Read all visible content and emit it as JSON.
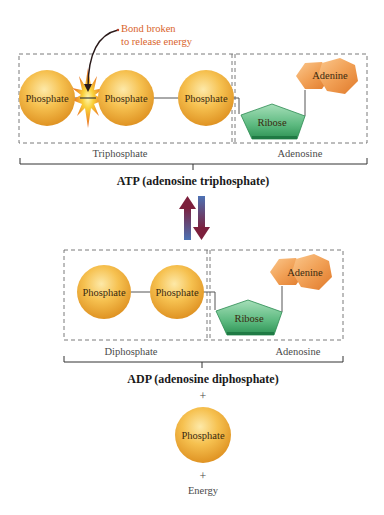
{
  "colors": {
    "phosphate_light": "#fde08a",
    "phosphate_mid": "#f3b03a",
    "phosphate_dark": "#d98a1a",
    "ribose_light": "#7fcf9c",
    "ribose_dark": "#2f9a5a",
    "adenine_light": "#f7b574",
    "adenine_dark": "#e27a2a",
    "annotation": "#d9642b",
    "arrow_up": "#7a2040",
    "arrow_down": "#3e6aa8",
    "dash": "#666666",
    "bracket": "#333333"
  },
  "annotation": {
    "line1": "Bond broken",
    "line2": "to release energy"
  },
  "atp": {
    "phosphates": [
      "Phosphate",
      "Phosphate",
      "Phosphate"
    ],
    "ribose": "Ribose",
    "adenine": "Adenine",
    "group_left": "Triphosphate",
    "group_right": "Adenosine",
    "title": "ATP (adenosine triphosphate)"
  },
  "adp": {
    "phosphates": [
      "Phosphate",
      "Phosphate"
    ],
    "ribose": "Ribose",
    "adenine": "Adenine",
    "group_left": "Diphosphate",
    "group_right": "Adenosine",
    "title": "ADP (adenosine diphosphate)"
  },
  "products": {
    "plus1": "+",
    "phosphate": "Phosphate",
    "plus2": "+",
    "energy": "Energy"
  }
}
